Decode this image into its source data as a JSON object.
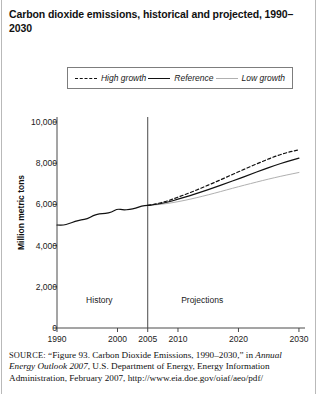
{
  "figure": {
    "title": "Carbon dioxide emissions, historical and projected, 1990–2030"
  },
  "legend": {
    "items": [
      {
        "label": "High growth",
        "style": "dashed",
        "color": "#111111",
        "icon": "dashed-line-icon"
      },
      {
        "label": "Reference",
        "style": "solid",
        "color": "#111111",
        "icon": "solid-line-icon"
      },
      {
        "label": "Low growth",
        "style": "light-solid",
        "color": "#b0b0b0",
        "icon": "light-line-icon"
      }
    ]
  },
  "source": {
    "prefix": "SOURCE:",
    "text_1": "“Figure 93. Carbon Dioxide Emissions, 1990–2030,” in ",
    "italic_1": "Annual Energy Outlook 2007",
    "text_2": ", U.S. Department of Energy, Energy Information Administration, February 2007, http://www.eia.doe.gov/oiaf/aeo/pdf/"
  },
  "chart_data": {
    "type": "line",
    "title": "Carbon dioxide emissions, historical and projected, 1990–2030",
    "xlabel": "",
    "ylabel": "Million metric tons",
    "xlim": [
      1990,
      2031
    ],
    "ylim": [
      0,
      10000
    ],
    "grid": false,
    "legend_position": "top",
    "y_ticks": [
      0,
      2000,
      4000,
      6000,
      8000,
      10000
    ],
    "y_tick_labels": [
      "0",
      "2,000",
      "4,000",
      "6,000",
      "8,000",
      "10,000"
    ],
    "x_ticks": [
      1990,
      2000,
      2005,
      2010,
      2020,
      2030
    ],
    "x_tick_labels": [
      "1990",
      "2000",
      "2005",
      "2010",
      "2020",
      "2030"
    ],
    "divider_x": 2005,
    "region_labels": [
      {
        "label": "History",
        "x": 1997
      },
      {
        "label": "Projections",
        "x": 2014
      }
    ],
    "series": [
      {
        "name": "Reference",
        "style": "solid",
        "color": "#111111",
        "x": [
          1990,
          1991,
          1992,
          1993,
          1994,
          1995,
          1996,
          1997,
          1998,
          1999,
          2000,
          2001,
          2002,
          2003,
          2004,
          2005,
          2006,
          2008,
          2010,
          2012,
          2014,
          2016,
          2018,
          2020,
          2022,
          2024,
          2026,
          2028,
          2030
        ],
        "values": [
          5000,
          4990,
          5060,
          5180,
          5250,
          5300,
          5460,
          5540,
          5560,
          5620,
          5790,
          5720,
          5760,
          5810,
          5930,
          5950,
          5980,
          6080,
          6250,
          6430,
          6620,
          6820,
          7030,
          7240,
          7460,
          7680,
          7890,
          8080,
          8250
        ]
      },
      {
        "name": "High growth",
        "style": "dashed",
        "color": "#111111",
        "x": [
          2005,
          2006,
          2008,
          2010,
          2012,
          2014,
          2016,
          2018,
          2020,
          2022,
          2024,
          2026,
          2028,
          2030
        ],
        "values": [
          5950,
          6000,
          6140,
          6350,
          6570,
          6810,
          7060,
          7320,
          7580,
          7840,
          8090,
          8330,
          8520,
          8650
        ]
      },
      {
        "name": "Low growth",
        "style": "light-solid",
        "color": "#b0b0b0",
        "x": [
          2005,
          2006,
          2008,
          2010,
          2012,
          2014,
          2016,
          2018,
          2020,
          2022,
          2024,
          2026,
          2028,
          2030
        ],
        "values": [
          5950,
          5970,
          6030,
          6130,
          6250,
          6390,
          6540,
          6700,
          6860,
          7010,
          7160,
          7300,
          7430,
          7550
        ]
      }
    ]
  }
}
